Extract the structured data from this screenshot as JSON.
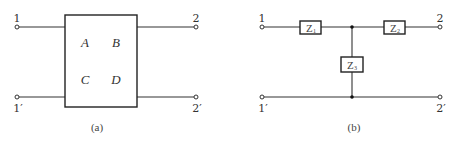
{
  "diagram_a": {
    "caption": "(a)",
    "terminals": {
      "in_top": "1",
      "in_bottom": "1′",
      "out_top": "2",
      "out_bottom": "2′"
    },
    "parameters": {
      "A": "A",
      "B": "B",
      "C": "C",
      "D": "D"
    }
  },
  "diagram_b": {
    "caption": "(b)",
    "terminals": {
      "in_top": "1",
      "in_bottom": "1′",
      "out_top": "2",
      "out_bottom": "2′"
    },
    "impedances": {
      "z1": {
        "main": "Z",
        "sub": "1"
      },
      "z2": {
        "main": "Z",
        "sub": "2"
      },
      "z3": {
        "main": "Z",
        "sub": "3"
      }
    }
  }
}
